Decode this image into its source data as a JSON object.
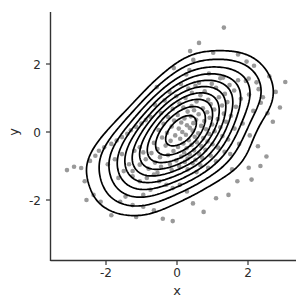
{
  "chart_data": {
    "type": "scatter",
    "subtype": "scatter-with-2d-density-contours",
    "title": "",
    "subtitle": "",
    "xlabel": "x",
    "ylabel": "y",
    "xlim": [
      -3.45,
      3.3
    ],
    "ylim": [
      -3.2,
      3.25
    ],
    "x_ticks": [
      -2,
      0,
      2
    ],
    "x_tick_labels": [
      "-2",
      "0",
      "2"
    ],
    "y_ticks": [
      -2,
      0,
      2
    ],
    "y_tick_labels": [
      "-2",
      "0",
      "2"
    ],
    "grid": false,
    "legend": false,
    "legend_position": "none",
    "point_color": "#999999",
    "point_radius_px": 2.3,
    "contour_color": "#000000",
    "contour_levels": 10,
    "axis_color": "#333333",
    "background_color": "#ffffff",
    "n_points": 200,
    "distribution": {
      "kind": "bivariate-normal",
      "mean_x": 0.0,
      "mean_y": 0.0,
      "sd_x": 1.0,
      "sd_y": 1.0,
      "correlation": 0.6
    },
    "points": [
      [
        1.32,
        3.07
      ],
      [
        0.37,
        2.38
      ],
      [
        1.02,
        2.33
      ],
      [
        0.46,
        2.12
      ],
      [
        1.96,
        2.07
      ],
      [
        2.17,
        1.95
      ],
      [
        -0.09,
        1.88
      ],
      [
        0.35,
        1.82
      ],
      [
        0.9,
        1.72
      ],
      [
        0.26,
        1.69
      ],
      [
        2.6,
        1.64
      ],
      [
        1.3,
        1.6
      ],
      [
        1.22,
        1.58
      ],
      [
        2.02,
        1.57
      ],
      [
        1.72,
        1.52
      ],
      [
        1.94,
        1.5
      ],
      [
        3.05,
        1.47
      ],
      [
        2.24,
        1.46
      ],
      [
        0.62,
        1.45
      ],
      [
        0.98,
        1.42
      ],
      [
        0.11,
        1.41
      ],
      [
        1.48,
        1.38
      ],
      [
        0.52,
        1.36
      ],
      [
        -0.57,
        1.32
      ],
      [
        1.1,
        1.3
      ],
      [
        0.32,
        1.28
      ],
      [
        2.3,
        1.26
      ],
      [
        1.61,
        1.22
      ],
      [
        0.78,
        1.2
      ],
      [
        -0.21,
        1.18
      ],
      [
        0.42,
        1.15
      ],
      [
        1.35,
        1.12
      ],
      [
        2.03,
        1.1
      ],
      [
        0.66,
        1.08
      ],
      [
        -0.02,
        1.05
      ],
      [
        1.18,
        1.02
      ],
      [
        0.24,
        1.0
      ],
      [
        1.8,
        0.98
      ],
      [
        0.88,
        0.95
      ],
      [
        -0.35,
        0.93
      ],
      [
        0.55,
        0.9
      ],
      [
        1.42,
        0.88
      ],
      [
        2.36,
        0.86
      ],
      [
        0.07,
        0.84
      ],
      [
        0.95,
        0.82
      ],
      [
        -0.62,
        0.8
      ],
      [
        1.27,
        0.78
      ],
      [
        0.41,
        0.76
      ],
      [
        1.66,
        0.74
      ],
      [
        0.18,
        0.72
      ],
      [
        0.73,
        0.7
      ],
      [
        -0.12,
        0.68
      ],
      [
        1.05,
        0.66
      ],
      [
        0.48,
        0.64
      ],
      [
        2.15,
        0.62
      ],
      [
        0.3,
        0.6
      ],
      [
        0.85,
        0.58
      ],
      [
        -0.45,
        0.56
      ],
      [
        1.32,
        0.54
      ],
      [
        0.61,
        0.52
      ],
      [
        0.02,
        0.5
      ],
      [
        1.52,
        0.48
      ],
      [
        0.39,
        0.46
      ],
      [
        -0.25,
        0.44
      ],
      [
        0.92,
        0.42
      ],
      [
        0.21,
        0.4
      ],
      [
        1.15,
        0.38
      ],
      [
        0.54,
        0.36
      ],
      [
        -0.08,
        0.34
      ],
      [
        0.77,
        0.32
      ],
      [
        1.38,
        0.3
      ],
      [
        0.12,
        0.28
      ],
      [
        0.46,
        0.26
      ],
      [
        -0.38,
        0.24
      ],
      [
        0.99,
        0.22
      ],
      [
        0.28,
        0.2
      ],
      [
        0.68,
        0.18
      ],
      [
        -0.15,
        0.16
      ],
      [
        1.22,
        0.14
      ],
      [
        0.36,
        0.12
      ],
      [
        0.05,
        0.1
      ],
      [
        0.82,
        0.08
      ],
      [
        -0.52,
        0.06
      ],
      [
        0.44,
        0.04
      ],
      [
        1.06,
        0.02
      ],
      [
        0.15,
        0.0
      ],
      [
        -0.28,
        -0.02
      ],
      [
        0.6,
        -0.04
      ],
      [
        0.91,
        -0.06
      ],
      [
        0.25,
        -0.08
      ],
      [
        -0.05,
        -0.1
      ],
      [
        1.28,
        -0.12
      ],
      [
        0.5,
        -0.14
      ],
      [
        -0.42,
        -0.16
      ],
      [
        0.74,
        -0.18
      ],
      [
        0.09,
        -0.2
      ],
      [
        1.44,
        -0.22
      ],
      [
        0.33,
        -0.24
      ],
      [
        -0.18,
        -0.26
      ],
      [
        0.86,
        -0.28
      ],
      [
        0.56,
        -0.3
      ],
      [
        -0.65,
        -0.32
      ],
      [
        0.18,
        -0.34
      ],
      [
        1.0,
        -0.36
      ],
      [
        0.41,
        -0.38
      ],
      [
        -0.32,
        -0.4
      ],
      [
        0.69,
        -0.42
      ],
      [
        0.03,
        -0.44
      ],
      [
        1.16,
        -0.46
      ],
      [
        0.27,
        -0.48
      ],
      [
        -0.55,
        -0.5
      ],
      [
        0.8,
        -0.52
      ],
      [
        0.48,
        -0.54
      ],
      [
        -0.1,
        -0.56
      ],
      [
        1.34,
        -0.58
      ],
      [
        0.2,
        -0.6
      ],
      [
        -0.72,
        -0.62
      ],
      [
        0.62,
        -0.64
      ],
      [
        0.36,
        -0.66
      ],
      [
        -0.25,
        -0.68
      ],
      [
        0.95,
        -0.7
      ],
      [
        0.12,
        -0.72
      ],
      [
        -0.48,
        -0.74
      ],
      [
        0.71,
        -0.76
      ],
      [
        0.3,
        -0.78
      ],
      [
        -0.88,
        -0.8
      ],
      [
        0.52,
        -0.82
      ],
      [
        -0.02,
        -0.84
      ],
      [
        1.1,
        -0.86
      ],
      [
        0.22,
        -0.88
      ],
      [
        -0.62,
        -0.9
      ],
      [
        0.44,
        -0.92
      ],
      [
        -0.2,
        -0.94
      ],
      [
        -1.05,
        -0.96
      ],
      [
        0.66,
        -0.98
      ],
      [
        0.06,
        -1.0
      ],
      [
        -0.45,
        -1.02
      ],
      [
        0.88,
        -1.05
      ],
      [
        -0.8,
        -1.08
      ],
      [
        0.3,
        -1.1
      ],
      [
        -0.15,
        -1.12
      ],
      [
        -1.25,
        -1.15
      ],
      [
        0.55,
        -1.18
      ],
      [
        -0.55,
        -1.2
      ],
      [
        1.55,
        -1.1
      ],
      [
        2.02,
        -1.05
      ],
      [
        -2.9,
        -1.02
      ],
      [
        -2.7,
        -1.06
      ],
      [
        -3.1,
        -1.12
      ],
      [
        -2.45,
        -0.85
      ],
      [
        -2.3,
        -0.7
      ],
      [
        -2.2,
        -0.55
      ],
      [
        -2.05,
        -0.45
      ],
      [
        -1.85,
        -0.35
      ],
      [
        -1.7,
        -0.25
      ],
      [
        -1.55,
        -0.15
      ],
      [
        -1.4,
        -0.05
      ],
      [
        -1.3,
        0.05
      ],
      [
        -1.15,
        0.15
      ],
      [
        -1.0,
        0.25
      ],
      [
        -0.88,
        0.35
      ],
      [
        -0.75,
        0.45
      ],
      [
        -1.55,
        -0.65
      ],
      [
        -1.75,
        -0.8
      ],
      [
        -1.95,
        -0.95
      ],
      [
        -1.2,
        -0.55
      ],
      [
        -1.05,
        -0.45
      ],
      [
        -0.95,
        -0.6
      ],
      [
        -1.35,
        -0.95
      ],
      [
        -1.5,
        -1.15
      ],
      [
        -1.65,
        -1.35
      ],
      [
        -1.25,
        -1.3
      ],
      [
        -1.05,
        -1.45
      ],
      [
        -0.85,
        -1.35
      ],
      [
        -0.65,
        -1.25
      ],
      [
        -0.5,
        -1.45
      ],
      [
        -0.3,
        -1.55
      ],
      [
        -0.12,
        -1.65
      ],
      [
        0.08,
        -1.55
      ],
      [
        0.28,
        -1.75
      ],
      [
        -0.75,
        -1.7
      ],
      [
        -0.95,
        -1.85
      ],
      [
        -1.45,
        -1.9
      ],
      [
        -1.6,
        -2.05
      ],
      [
        -1.25,
        -2.15
      ],
      [
        -0.95,
        -2.2
      ],
      [
        -0.65,
        -2.3
      ],
      [
        -0.4,
        -2.55
      ],
      [
        -0.12,
        -2.62
      ],
      [
        -1.15,
        -2.5
      ],
      [
        -1.85,
        -2.45
      ],
      [
        -2.15,
        -2.05
      ],
      [
        -2.35,
        -1.85
      ],
      [
        -2.55,
        -2.0
      ],
      [
        0.45,
        -2.1
      ],
      [
        0.75,
        -2.35
      ],
      [
        1.1,
        -1.95
      ],
      [
        1.45,
        -1.85
      ],
      [
        1.7,
        -1.45
      ],
      [
        2.1,
        -1.4
      ],
      [
        2.35,
        -1.0
      ],
      [
        2.52,
        -0.72
      ],
      [
        2.28,
        -0.42
      ],
      [
        2.7,
        0.3
      ],
      [
        2.55,
        0.55
      ],
      [
        2.9,
        0.72
      ],
      [
        2.42,
        1.02
      ],
      [
        2.78,
        1.18
      ],
      [
        1.62,
        0.1
      ],
      [
        1.85,
        0.25
      ],
      [
        2.05,
        -0.1
      ],
      [
        1.5,
        -0.65
      ],
      [
        1.75,
        -0.35
      ],
      [
        -2.6,
        -1.45
      ],
      [
        0.62,
        2.62
      ],
      [
        1.72,
        2.28
      ]
    ],
    "contours": [
      {
        "level": 1,
        "density": 0.02,
        "label": "outermost"
      },
      {
        "level": 2,
        "density": 0.04
      },
      {
        "level": 3,
        "density": 0.06
      },
      {
        "level": 4,
        "density": 0.08
      },
      {
        "level": 5,
        "density": 0.1
      },
      {
        "level": 6,
        "density": 0.12
      },
      {
        "level": 7,
        "density": 0.14
      },
      {
        "level": 8,
        "density": 0.16
      },
      {
        "level": 9,
        "density": 0.18
      },
      {
        "level": 10,
        "density": 0.2,
        "label": "innermost"
      }
    ]
  },
  "axes": {
    "x_title": "x",
    "y_title": "y"
  }
}
